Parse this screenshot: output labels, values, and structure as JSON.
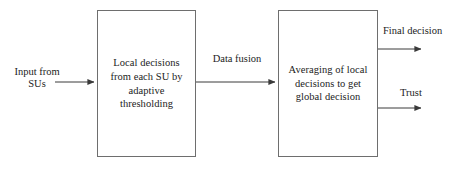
{
  "diagram": {
    "type": "block-flow-diagram",
    "width": 451,
    "height": 172,
    "background_color": "#ffffff",
    "line_color": "#4a4a4a",
    "box_border_color": "#6e6e6e",
    "text_color": "#1c1c1c"
  },
  "nodes": [
    {
      "id": "local-decisions",
      "label": "Local decisions\nfrom each SU by\nadaptive\nthresholding",
      "x": 97,
      "y": 10,
      "width": 99,
      "height": 147
    },
    {
      "id": "averaging",
      "label": "Averaging of local\ndecisions to get\nglobal decision",
      "x": 278,
      "y": 10,
      "width": 100,
      "height": 147
    }
  ],
  "edges": [
    {
      "id": "input-edge",
      "label": "Input from\nSUs",
      "from": "input-source",
      "to": "local-decisions",
      "x1": 55,
      "y1": 82,
      "x2": 96,
      "y2": 82
    },
    {
      "id": "data-fusion-edge",
      "label": "Data fusion",
      "from": "local-decisions",
      "to": "averaging",
      "x1": 196,
      "y1": 82,
      "x2": 277,
      "y2": 82
    },
    {
      "id": "final-decision-edge",
      "label": "Final decision",
      "from": "averaging",
      "to": "output-final",
      "x1": 378,
      "y1": 49,
      "x2": 424,
      "y2": 49
    },
    {
      "id": "trust-edge",
      "label": "Trust",
      "from": "averaging",
      "to": "output-trust",
      "x1": 378,
      "y1": 108,
      "x2": 424,
      "y2": 108
    }
  ]
}
